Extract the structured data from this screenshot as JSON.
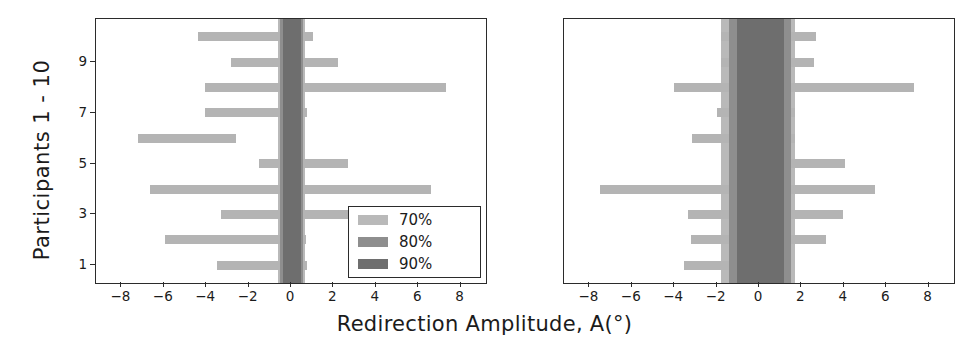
{
  "chart_data": {
    "type": "bar",
    "title": "",
    "xlabel": "Redirection Amplitude, A(°)",
    "ylabel": "Participants 1 - 10",
    "xlim": [
      -9.2,
      9.2
    ],
    "ylim": [
      0.3,
      10.7
    ],
    "xticks": [
      -8,
      -6,
      -4,
      -2,
      0,
      2,
      4,
      6,
      8
    ],
    "xticklabels": [
      "−8",
      "−6",
      "−4",
      "−2",
      "0",
      "2",
      "4",
      "6",
      "8"
    ],
    "yticks": [
      1,
      3,
      5,
      7,
      9
    ],
    "yticklabels": [
      "1",
      "3",
      "5",
      "7",
      "9"
    ],
    "grid": false,
    "legend": {
      "position": "lower right",
      "entries": [
        {
          "label": "70%",
          "color": "#b9b9b9"
        },
        {
          "label": "80%",
          "color": "#8e8e8e"
        },
        {
          "label": "90%",
          "color": "#6e6e6e"
        }
      ]
    },
    "panels": [
      {
        "name": "left-panel",
        "participants": [
          1,
          2,
          3,
          4,
          5,
          6,
          7,
          8,
          9,
          10
        ],
        "bars_70": [
          {
            "participant": 10,
            "low": -4.4,
            "high": 1.05
          },
          {
            "participant": 9,
            "low": -2.85,
            "high": 2.2
          },
          {
            "participant": 8,
            "low": -4.05,
            "high": 7.3
          },
          {
            "participant": 7,
            "low": -4.05,
            "high": 0.75
          },
          {
            "participant": 6,
            "low": -7.2,
            "high": -2.6
          },
          {
            "participant": 5,
            "low": -1.5,
            "high": 2.7
          },
          {
            "participant": 4,
            "low": -6.65,
            "high": 6.6
          },
          {
            "participant": 3,
            "low": -3.3,
            "high": 4.4
          },
          {
            "participant": 2,
            "low": -5.95,
            "high": 0.7
          },
          {
            "participant": 1,
            "low": -3.5,
            "high": 0.75
          }
        ],
        "band_70": {
          "low": -0.62,
          "high": 0.68
        },
        "band_80": {
          "low": -0.52,
          "high": 0.58
        },
        "band_90": {
          "low": -0.4,
          "high": 0.45
        }
      },
      {
        "name": "right-panel",
        "participants": [
          1,
          2,
          3,
          4,
          5,
          6,
          7,
          8,
          9,
          10
        ],
        "bars_70": [
          {
            "participant": 10,
            "low": -1.8,
            "high": 2.7
          },
          {
            "participant": 9,
            "low": -1.8,
            "high": 2.6
          },
          {
            "participant": 8,
            "low": -4.0,
            "high": 7.3
          },
          {
            "participant": 7,
            "low": -2.0,
            "high": 1.7
          },
          {
            "participant": 6,
            "low": -3.15,
            "high": 1.7
          },
          {
            "participant": 5,
            "low": 1.4,
            "high": 4.05
          },
          {
            "participant": 4,
            "low": -7.5,
            "high": 5.45
          },
          {
            "participant": 3,
            "low": -3.35,
            "high": 3.95
          },
          {
            "participant": 2,
            "low": -3.2,
            "high": 3.15
          },
          {
            "participant": 1,
            "low": -3.55,
            "high": -1.4
          }
        ],
        "band_70": {
          "low": -1.78,
          "high": 1.7
        },
        "band_80": {
          "low": -1.42,
          "high": 1.52
        },
        "band_90": {
          "low": -1.05,
          "high": 1.18
        }
      }
    ]
  },
  "axis": {
    "xlabel": "Redirection Amplitude, A(°)",
    "ylabel": "Participants 1 - 10"
  },
  "legend": {
    "items": [
      {
        "label": "70%"
      },
      {
        "label": "80%"
      },
      {
        "label": "90%"
      }
    ]
  }
}
